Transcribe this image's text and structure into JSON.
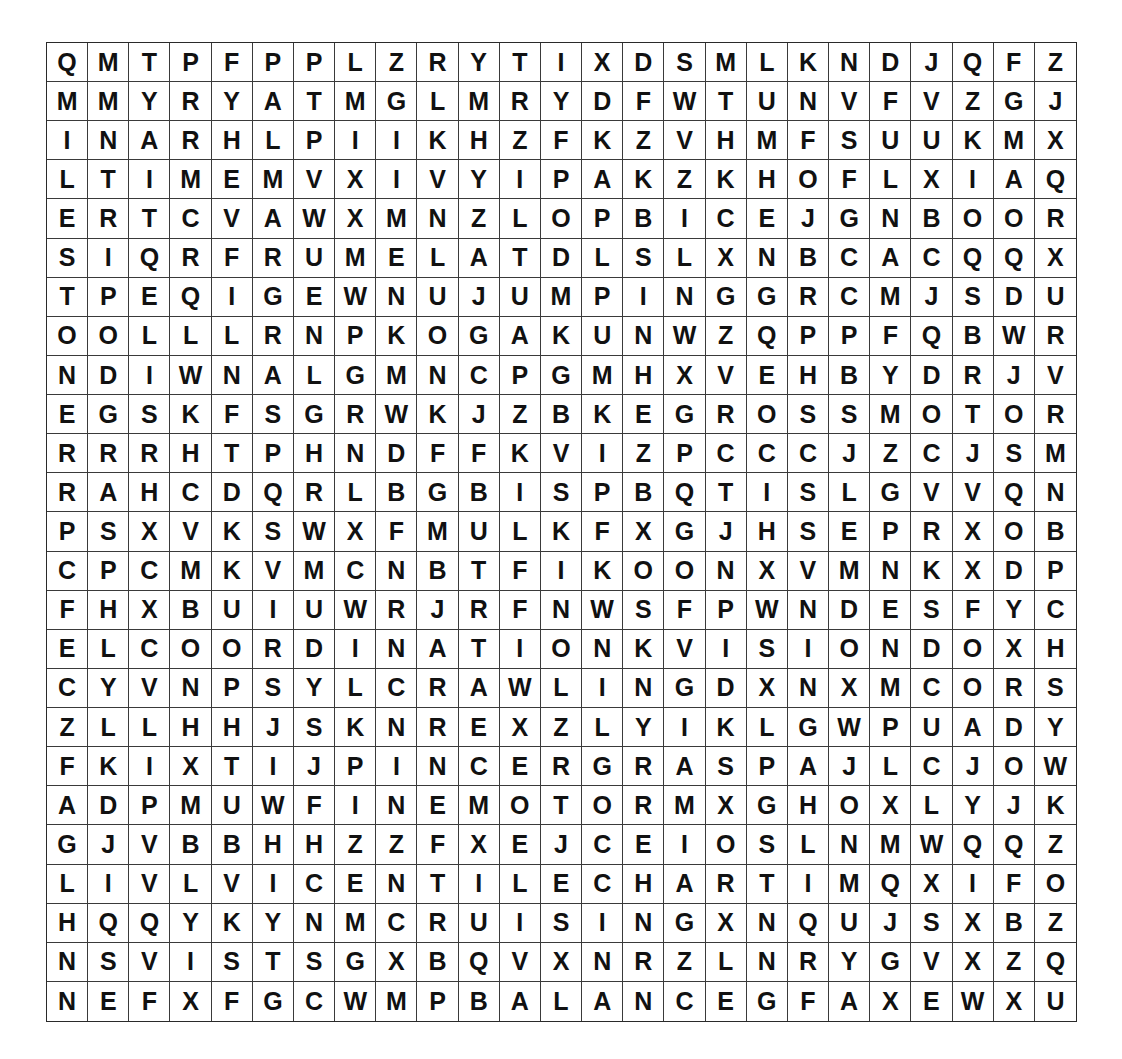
{
  "puzzle": {
    "type": "word-search",
    "rows": 25,
    "cols": 25,
    "grid": [
      "QMTPFPPLZRYTIXDSMLKNDJQFZ",
      "MMYRYATMGLMRYDFWTUNVFVZGJ",
      "INARHLPIIKHZFKZVHMFSUUKMX",
      "LTIMEMVXIVYIPAKZKHOFLXIAQ",
      "ERTCVAWXMNZLOPBICEJGNBOOR",
      "SIQRFRUMELATDLSLXNBCACQQX",
      "TPEQIGEWNUJUMPINGGRCMJSDU",
      "OOLLLRNPKOGAKUNWZQPPFQBWR",
      "NDIWNALGMNCPGMHXVEHBYDRJV",
      "EGSKFSGRWKJZBKEGROSSMOTOR",
      "RRRHTPHNDFFKVIZPCCCJZCJSM",
      "RAHCDQRLBGBISPBQTISLGVVQN",
      "PSXVKSWXFMULKFXGJHSEPRXOB",
      "CPCMKVMCNBTFIKOONXVMNKXDP",
      "FHXBUIUWRJRFNWSFPWNDESFYC",
      "ELCOORDINATIONKVISIONDOXH",
      "CYVNPSYLCRAWLINGDXNXMCORS",
      "ZLLHHJSKNREXZLYIKLGWPUADY",
      "FKIXTIJPINCERGRASPAJLCJOW",
      "ADPMUWFINEMOTORMXGHOXLYJK",
      "GJVBBHHZZFXEJCEIOSLNMWQQZ",
      "LIVLVICENTILECHARTIMQXIFO",
      "HQQYKYNMCRUISINGXNQUJSXBZ",
      "NSVISTSGXBQVXNRZLNRYGVXZQ",
      "NEFXFGCWMPBALANCEGFAXEWXU"
    ]
  }
}
